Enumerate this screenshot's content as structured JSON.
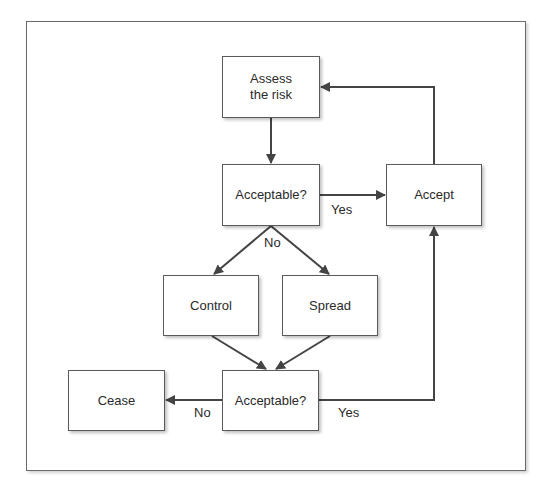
{
  "diagram": {
    "type": "flowchart",
    "colors": {
      "line": "#444444",
      "box_border": "#5a5a5a",
      "text": "#2a2a2a",
      "background": "#ffffff"
    },
    "nodes": [
      {
        "id": "assess",
        "label": "Assess\nthe risk"
      },
      {
        "id": "acceptable1",
        "label": "Acceptable?"
      },
      {
        "id": "accept",
        "label": "Accept"
      },
      {
        "id": "control",
        "label": "Control"
      },
      {
        "id": "spread",
        "label": "Spread"
      },
      {
        "id": "acceptable2",
        "label": "Acceptable?"
      },
      {
        "id": "cease",
        "label": "Cease"
      }
    ],
    "edges": [
      {
        "from": "assess",
        "to": "acceptable1",
        "label": ""
      },
      {
        "from": "acceptable1",
        "to": "accept",
        "label": "Yes"
      },
      {
        "from": "acceptable1",
        "to": "control",
        "label": "No"
      },
      {
        "from": "acceptable1",
        "to": "spread",
        "label": "No"
      },
      {
        "from": "control",
        "to": "acceptable2",
        "label": ""
      },
      {
        "from": "spread",
        "to": "acceptable2",
        "label": ""
      },
      {
        "from": "acceptable2",
        "to": "cease",
        "label": "No"
      },
      {
        "from": "acceptable2",
        "to": "accept",
        "label": "Yes"
      },
      {
        "from": "accept",
        "to": "assess",
        "label": ""
      }
    ],
    "edge_labels": {
      "yes_top": "Yes",
      "no_top": "No",
      "no_bottom": "No",
      "yes_bottom": "Yes"
    }
  }
}
